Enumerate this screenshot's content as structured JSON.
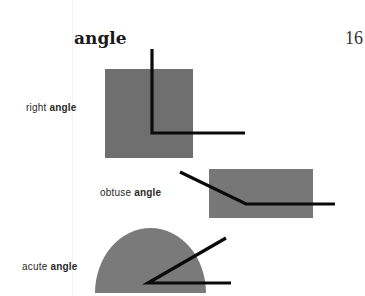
{
  "page": {
    "heading": "angle",
    "page_number": "16"
  },
  "figures": [
    {
      "type": "right",
      "prefix": "right",
      "word": "angle"
    },
    {
      "type": "obtuse",
      "prefix": "obtuse",
      "word": "angle"
    },
    {
      "type": "acute",
      "prefix": "acute",
      "word": "angle"
    }
  ],
  "colors": {
    "shape_fill": "#6e6e6e",
    "obtuse_fill": "#777777",
    "acute_fill": "#7a7a7a",
    "line": "#0a0a0a"
  }
}
